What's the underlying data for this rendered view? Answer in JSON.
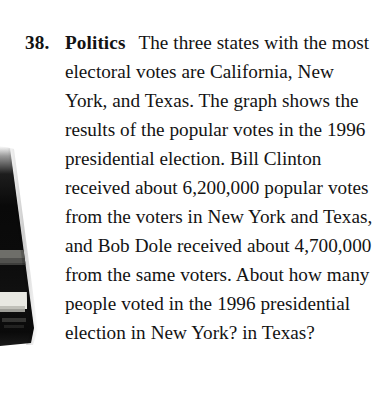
{
  "page": {
    "background_color": "#ffffff",
    "text_color": "#131313"
  },
  "exercise": {
    "number": "38.",
    "category_label": "Politics",
    "problem_text": "The three states with the most electoral votes are California, New York, and Texas. The graph shows the results of the popular votes in the 1996 presidential election. Bill Clinton received about 6,200,000 popular votes from the voters in New York and Texas, and Bob Dole received about 4,700,000 from the same voters. About how many people voted in the 1996 presidential election in New York? in Texas?",
    "lines": [
      "The three states with",
      "the most electoral votes are",
      "California, New York, and Texas.",
      "The graph shows the results of",
      "the popular votes in the 1996",
      "presidential election. Bill Clinton",
      "received about 6,200,000",
      "popular votes from the voters in",
      "New York and Texas, and Bob",
      "Dole received about 4,700,000",
      "from the same voters. About",
      "how many people voted in the",
      "1996 presidential election in",
      "New York? in Texas?"
    ],
    "referenced_values": {
      "election_year": "1996",
      "clinton_votes_ny_tx": "6,200,000",
      "dole_votes_ny_tx": "4,700,000",
      "states": [
        "California",
        "New York",
        "Texas"
      ],
      "candidates": [
        "Bill Clinton",
        "Bob Dole"
      ]
    }
  },
  "artifact": {
    "name": "scan-edge-shadow",
    "description": "dark wedge-shaped scanning shadow along left page gutter",
    "color_dark": "#0a0a0a",
    "color_mid": "#6e6e6e",
    "color_light": "#e8e8e6"
  }
}
